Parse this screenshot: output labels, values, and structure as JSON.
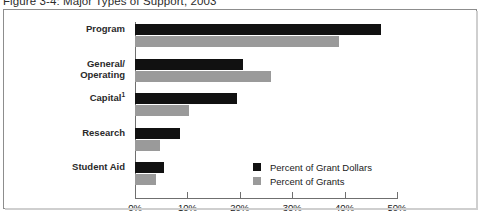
{
  "figure": {
    "title": "Figure 3-4: Major Types of Support, 2003"
  },
  "legend": {
    "entries": [
      {
        "label": "Percent of Grant Dollars",
        "color": "#111111",
        "key": "dollars"
      },
      {
        "label": "Percent of Grants",
        "color": "#9a9a9a",
        "key": "grants"
      }
    ]
  },
  "axis": {
    "tick_labels": [
      "0%",
      "10%",
      "20%",
      "30%",
      "40%",
      "50%"
    ]
  },
  "chart_data": {
    "type": "bar",
    "orientation": "horizontal",
    "title": "Figure 3-4: Major Types of Support, 2003",
    "xlabel": "",
    "ylabel": "",
    "xlim": [
      0,
      50
    ],
    "xticks": [
      0,
      10,
      20,
      30,
      40,
      50
    ],
    "xtick_labels": [
      "0%",
      "10%",
      "20%",
      "30%",
      "40%",
      "50%"
    ],
    "grid": false,
    "legend_position": "inside-center-right",
    "categories": [
      "Program",
      "General/\nOperating",
      "Capital¹",
      "Research",
      "Student Aid"
    ],
    "category_labels": [
      "Program",
      "General/ Operating",
      "Capital1",
      "Research",
      "Student Aid"
    ],
    "series": [
      {
        "name": "Percent of Grant Dollars",
        "color": "#111111",
        "values": [
          47.0,
          20.6,
          19.5,
          8.6,
          5.5
        ]
      },
      {
        "name": "Percent of Grants",
        "color": "#9a9a9a",
        "values": [
          39.0,
          26.0,
          10.3,
          4.8,
          4.0
        ]
      }
    ],
    "footnote_marker": "1",
    "units": "percent"
  }
}
